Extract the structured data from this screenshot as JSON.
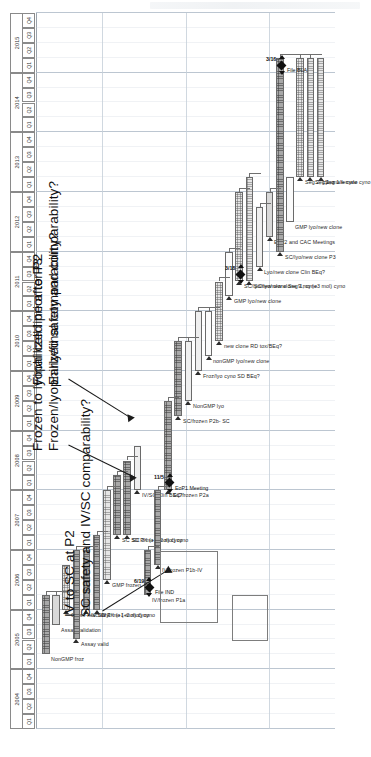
{
  "chart_data": {
    "type": "bar",
    "xlabel": "",
    "ylabel": "",
    "axis": {
      "orientation": "vertical-rotated",
      "years": [
        "2004",
        "2005",
        "2006",
        "2007",
        "2008",
        "2009",
        "2010",
        "2011",
        "2012",
        "2013",
        "2014",
        "2015"
      ],
      "quarters": [
        "Q1",
        "Q2",
        "Q3",
        "Q4"
      ],
      "range_start": "2004-Q1",
      "range_end": "2015-Q4",
      "grid": true
    },
    "categories": [
      "NonGMP froz",
      "Assay validation",
      "Cross-reactivity",
      "Assay valid",
      "IV SD PK (+1 mol) cyno",
      "IV 1 mo (+2 mol) cyno",
      "GMP frozen",
      "SC SD PK (+1 mol) cyno",
      "SC 3 mo (+2 mol) cyno",
      "IV/SC Clin BEq?",
      "IV/frozen P1a",
      "IV/frozen P1b-IV",
      "SC/frozen P2a",
      "SC/frozen P2b- SC",
      "NonGMP lyo",
      "Froz/lyo cyno SD BEq?",
      "nonGMP lyo/new clone",
      "new clone RD tox/BEq?",
      "GMP lyo/new clone",
      "SC/lyo/new clone  Seg 1, cyno",
      "SC/lyo/new clone 9 mo (+3 mol) cyno",
      "Lyo/new clone Clin BEq?",
      "EoP2 and CAC Meetings",
      "SC/lyo/new clone P3",
      "GMP lyo/new clone ",
      "Seg 2, cyno",
      "Seg 1, male cyno",
      "Seg 1 female cyno"
    ],
    "tasks": [
      {
        "label": "NonGMP froz",
        "start": "2005-Q2",
        "end": "2006-Q1",
        "style": "hatch"
      },
      {
        "label": "Assay validation",
        "start": "2005-Q4",
        "end": "2006-Q1",
        "style": "mid"
      },
      {
        "label": "Cross-reactivity",
        "start": "2006-Q1",
        "end": "2006-Q3",
        "style": "dots"
      },
      {
        "label": "Assay valid",
        "start": "2005-Q3",
        "end": "2006-Q4",
        "style": "hatch"
      },
      {
        "label": "IV SD PK (+1 mol) cyno",
        "start": "2006-Q1",
        "end": "2006-Q4",
        "style": "hatch"
      },
      {
        "label": "IV 1 mo (+2 mol) cyno",
        "start": "2006-Q1",
        "end": "2007-Q1",
        "style": "hatch"
      },
      {
        "label": "GMP frozen",
        "start": "2006-Q3",
        "end": "2007-Q4",
        "style": "dots"
      },
      {
        "label": "SC SD PK (+1 mol) cyno",
        "start": "2007-Q2",
        "end": "2008-Q1",
        "style": "hatch"
      },
      {
        "label": "SC 3 mo (+2 mol) cyno",
        "start": "2007-Q2",
        "end": "2008-Q2",
        "style": "hatch"
      },
      {
        "label": "IV/SC Clin BEq?",
        "start": "2008-Q1",
        "end": "2008-Q3",
        "style": "light"
      },
      {
        "label": "IV/frozen P1a",
        "start": "2006-Q2",
        "end": "2006-Q4",
        "style": "hatch"
      },
      {
        "label": "IV/frozen P1b-IV",
        "start": "2006-Q4",
        "end": "2007-Q4",
        "style": "hatch"
      },
      {
        "label": "SC/frozen P2a",
        "start": "2008-Q1",
        "end": "2009-Q2",
        "style": "hatch"
      },
      {
        "label": "SC/frozen P2b- SC",
        "start": "2009-Q2",
        "end": "2010-Q2",
        "style": "hatch"
      },
      {
        "label": "NonGMP lyo",
        "start": "2009-Q3",
        "end": "2010-Q2",
        "style": "light"
      },
      {
        "label": "Froz/lyo cyno SD BEq?",
        "start": "2010-Q1",
        "end": "2010-Q4",
        "style": "light"
      },
      {
        "label": "nonGMP lyo/new clone",
        "start": "2010-Q2",
        "end": "2010-Q4",
        "style": "open"
      },
      {
        "label": "new clone RD tox/BEq?",
        "start": "2010-Q3",
        "end": "2011-Q2",
        "style": "dots"
      },
      {
        "label": "GMP lyo/new clone",
        "start": "2011-Q2",
        "end": "2011-Q4",
        "style": "open"
      },
      {
        "label": "SC/lyo/new clone  Seg 1, cyno",
        "start": "2011-Q3",
        "end": "2012-Q4",
        "style": "dots"
      },
      {
        "label": "SC/lyo/new clone 9 mo (+3 mol) cyno",
        "start": "2011-Q3",
        "end": "2013-Q1",
        "style": "dots"
      },
      {
        "label": "Lyo/new clone Clin BEq?",
        "start": "2011-Q4",
        "end": "2012-Q3",
        "style": "light"
      },
      {
        "label": "EoP2 and CAC Meetings",
        "start": "2012-Q2",
        "end": "2012-Q4",
        "style": "mid"
      },
      {
        "label": "SC/lyo/new clone P3",
        "start": "2012-Q1",
        "end": "2015-Q1",
        "style": "hatch"
      },
      {
        "label": "GMP lyo/new clone ",
        "start": "2012-Q3",
        "end": "2013-Q1",
        "style": "open"
      },
      {
        "label": "Seg 2, cyno",
        "start": "2013-Q2",
        "end": "2015-Q1",
        "style": "dots"
      },
      {
        "label": "Seg 1, male cyno",
        "start": "2013-Q2",
        "end": "2015-Q1",
        "style": "dots"
      },
      {
        "label": "Seg 1 female cyno",
        "start": "2013-Q2",
        "end": "2015-Q1",
        "style": "dots"
      }
    ],
    "milestones": [
      {
        "label": "File IND",
        "date": "6/19",
        "at": "2006-Q2"
      },
      {
        "label": "EoP1 Meeting",
        "date": "11/5",
        "at": "2008-Q1"
      },
      {
        "label": "",
        "date": "3/18",
        "at": "2011-Q3"
      },
      {
        "label": "File BLA",
        "date": "3/16",
        "at": "2015-Q1"
      }
    ],
    "annotations": [
      {
        "id": "ann-iv-sc",
        "lines": [
          "IV to SC at P2",
          "SC safety and IV/SC comparability?"
        ]
      },
      {
        "id": "ann-lyo",
        "lines": [
          "Frozen to lyophilized prior to P3",
          "Frozen/lyophilized safety and comparability?"
        ]
      },
      {
        "id": "ann-cellline",
        "lines": [
          "Final cell line after P2",
          "Early/final comparability?"
        ]
      }
    ],
    "legend": {
      "position": "none",
      "entries": []
    }
  }
}
